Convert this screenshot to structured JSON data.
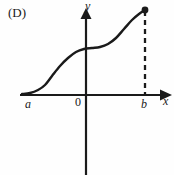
{
  "figure": {
    "choice_label": "(D)",
    "background_color": "#fefefe",
    "ink_color": "#1a1a1a"
  },
  "axes": {
    "y_axis_label": "y",
    "x_axis_label": "x",
    "origin_label": "0",
    "left_bound_label": "a",
    "right_bound_label": "b"
  },
  "chart_data": {
    "type": "line",
    "title": "",
    "subtitle": "",
    "xlabel": "x",
    "ylabel": "y",
    "legend": [],
    "grid": false,
    "axis_style": "arrows",
    "origin_label": "0",
    "xtick_labels": [
      "a",
      "0",
      "b"
    ],
    "xtick_pixels": [
      22,
      86,
      145
    ],
    "ytick_labels": [],
    "annotations": [
      {
        "name": "endpoint-dot",
        "shape": "filled-circle",
        "x_label": "b",
        "x_pixel": 145,
        "y_pixel": 10
      },
      {
        "name": "dashed-drop-line",
        "shape": "dashed-vertical-segment",
        "x_label": "b",
        "x_pixel": 145,
        "y_top_pixel": 11,
        "y_bottom_pixel": 95
      }
    ],
    "series": [
      {
        "name": "curve",
        "description": "increasing double-sigmoid (S on S) curve from a to b with a plateau near x = 0",
        "style": "solid",
        "points_pixel": [
          [
            22,
            94
          ],
          [
            30,
            93
          ],
          [
            38,
            90
          ],
          [
            45,
            85
          ],
          [
            52,
            76
          ],
          [
            60,
            66
          ],
          [
            68,
            58
          ],
          [
            76,
            52
          ],
          [
            84,
            49
          ],
          [
            92,
            48
          ],
          [
            100,
            47
          ],
          [
            108,
            44
          ],
          [
            116,
            38
          ],
          [
            124,
            29
          ],
          [
            132,
            20
          ],
          [
            139,
            14
          ],
          [
            145,
            10
          ]
        ]
      }
    ]
  }
}
